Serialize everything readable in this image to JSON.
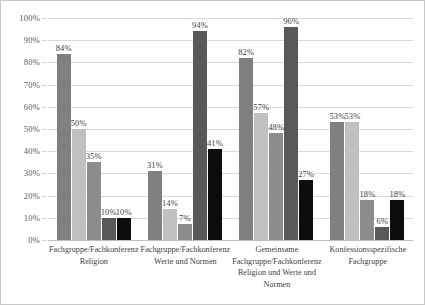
{
  "chart": {
    "title": "",
    "axis": {
      "y_ticks": [
        "100%",
        "90%",
        "80%",
        "70%",
        "60%",
        "50%",
        "40%",
        "30%",
        "20%",
        "10%",
        "0%"
      ]
    }
  },
  "chart_data": {
    "type": "bar",
    "title": "",
    "subtitle": "",
    "xlabel": "",
    "ylabel": "",
    "ylim": [
      0,
      100
    ],
    "ytick_step": 10,
    "grid": true,
    "legend": "none",
    "value_labels": true,
    "value_suffix": "%",
    "orientation": "vertical",
    "grouping": "clustered",
    "categories": [
      "Fachgruppe/Fachkonferenz Religion",
      "Fachgruppe/Fachkonferenz Werte und Normen",
      "Gemeinsame Fachgruppe/Fachkonferenz Religion und Werte und Normen",
      "Konfessionsspezifische Fachgruppe"
    ],
    "series": [
      {
        "name": "Reihe 1",
        "color": "#808080",
        "values": [
          84,
          31,
          82,
          53
        ],
        "labels": [
          "84%",
          "31%",
          "82%",
          "53%"
        ]
      },
      {
        "name": "Reihe 2",
        "color": "#c0c0c0",
        "values": [
          50,
          14,
          57,
          53
        ],
        "labels": [
          "50%",
          "14%",
          "57%",
          "53%"
        ]
      },
      {
        "name": "Reihe 3",
        "color": "#8c8c8c",
        "values": [
          35,
          7,
          48,
          18
        ],
        "labels": [
          "35%",
          "7%",
          "48%",
          "18%"
        ]
      },
      {
        "name": "Reihe 4",
        "color": "#595959",
        "values": [
          10,
          94,
          96,
          6
        ],
        "labels": [
          "10%",
          "94%",
          "96%",
          "6%"
        ]
      },
      {
        "name": "Reihe 5",
        "color": "#0d0d0d",
        "values": [
          10,
          41,
          27,
          18
        ],
        "labels": [
          "10%",
          "41%",
          "27%",
          "18%"
        ]
      }
    ]
  }
}
